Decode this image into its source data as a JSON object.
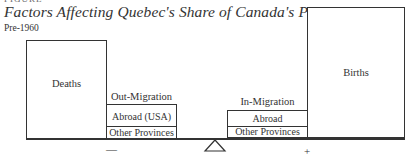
{
  "figure": {
    "header_fragment": "FIGURE",
    "title": "Factors Affecting Quebec's Share of Canada's Population",
    "period": "Pre-1960"
  },
  "left_side": {
    "sign": "—",
    "deaths": {
      "label": "Deaths"
    },
    "out_migration": {
      "label": "Out-Migration",
      "components": [
        "Abroad (USA)",
        "Other Provinces"
      ]
    }
  },
  "right_side": {
    "sign": "+",
    "in_migration": {
      "label": "In-Migration",
      "components": [
        "Abroad",
        "Other Provinces"
      ]
    },
    "births": {
      "label": "Births"
    }
  },
  "fulcrum": {
    "icon": "triangle-fulcrum-icon"
  }
}
